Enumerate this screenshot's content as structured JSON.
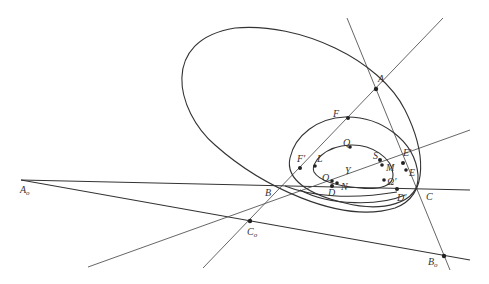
{
  "diagram": {
    "type": "projective-geometry-conics",
    "points": [
      {
        "id": "A",
        "label": "A",
        "x": 376,
        "y": 89,
        "lx": 378,
        "ly": 82
      },
      {
        "id": "F",
        "label": "F",
        "x": 348,
        "y": 118,
        "lx": 333,
        "ly": 117
      },
      {
        "id": "E_prime",
        "label": "E'",
        "x": 403,
        "y": 163,
        "lx": 403,
        "ly": 156
      },
      {
        "id": "E",
        "label": "E",
        "x": 406,
        "y": 170,
        "lx": 409,
        "ly": 176
      },
      {
        "id": "F_prime",
        "label": "F'",
        "x": 300,
        "y": 168,
        "lx": 297,
        "ly": 162
      },
      {
        "id": "Q",
        "label": "Q",
        "x": 350,
        "y": 147,
        "lx": 343,
        "ly": 146
      },
      {
        "id": "L",
        "label": "L",
        "x": 315,
        "y": 166,
        "lx": 317,
        "ly": 162
      },
      {
        "id": "S",
        "label": "S",
        "x": 380,
        "y": 160,
        "lx": 373,
        "ly": 159
      },
      {
        "id": "M",
        "label": "M",
        "x": 382,
        "y": 165,
        "lx": 386,
        "ly": 171
      },
      {
        "id": "Y",
        "label": "Y",
        "x": 348,
        "y": 170,
        "lx": 345,
        "ly": 174
      },
      {
        "id": "Omega_prime",
        "label": "Ω'",
        "x": 384,
        "y": 180,
        "lx": 387,
        "ly": 185
      },
      {
        "id": "O",
        "label": "O",
        "x": 332,
        "y": 181,
        "lx": 322,
        "ly": 181
      },
      {
        "id": "N",
        "label": "N",
        "x": 337,
        "y": 183,
        "lx": 341,
        "ly": 190
      },
      {
        "id": "D",
        "label": "D",
        "x": 332,
        "y": 186,
        "lx": 328,
        "ly": 196
      },
      {
        "id": "D_prime",
        "label": "D'",
        "x": 397,
        "y": 189,
        "lx": 397,
        "ly": 201
      },
      {
        "id": "B",
        "label": "B",
        "x": 283,
        "y": 186,
        "lx": 265,
        "ly": 196
      },
      {
        "id": "C",
        "label": "C",
        "x": 416,
        "y": 190,
        "lx": 426,
        "ly": 200
      },
      {
        "id": "A_o",
        "label": "A",
        "sub": "o",
        "x": 21,
        "y": 180,
        "lx": 20,
        "ly": 193
      },
      {
        "id": "C_o",
        "label": "C",
        "sub": "o",
        "x": 250,
        "y": 221,
        "lx": 247,
        "ly": 235
      },
      {
        "id": "B_o",
        "label": "B",
        "sub": "o",
        "x": 444,
        "y": 256,
        "lx": 428,
        "ly": 265
      }
    ],
    "lines": [
      {
        "name": "line-A-B",
        "x1": 443,
        "y1": 18,
        "x2": 203,
        "y2": 268
      },
      {
        "name": "line-A-C",
        "x1": 347,
        "y1": 18,
        "x2": 450,
        "y2": 270
      },
      {
        "name": "line-Ao-C",
        "x1": 21,
        "y1": 180,
        "x2": 470,
        "y2": 190
      },
      {
        "name": "line-Ao-Bo",
        "x1": 21,
        "y1": 180,
        "x2": 470,
        "y2": 260
      },
      {
        "name": "line-lower-left-E",
        "x1": 88,
        "y1": 267,
        "x2": 470,
        "y2": 130
      }
    ],
    "conics": [
      {
        "name": "large-ellipse",
        "cx": 300,
        "cy": 122,
        "rx": 140,
        "ry": 72,
        "rot": 28
      },
      {
        "name": "middle-ellipse",
        "cx": 355,
        "cy": 155,
        "rx": 70,
        "ry": 40,
        "rot": 10
      },
      {
        "name": "inner-oval",
        "cx": 352,
        "cy": 168,
        "rx": 44,
        "ry": 21,
        "rot": 8
      }
    ]
  }
}
